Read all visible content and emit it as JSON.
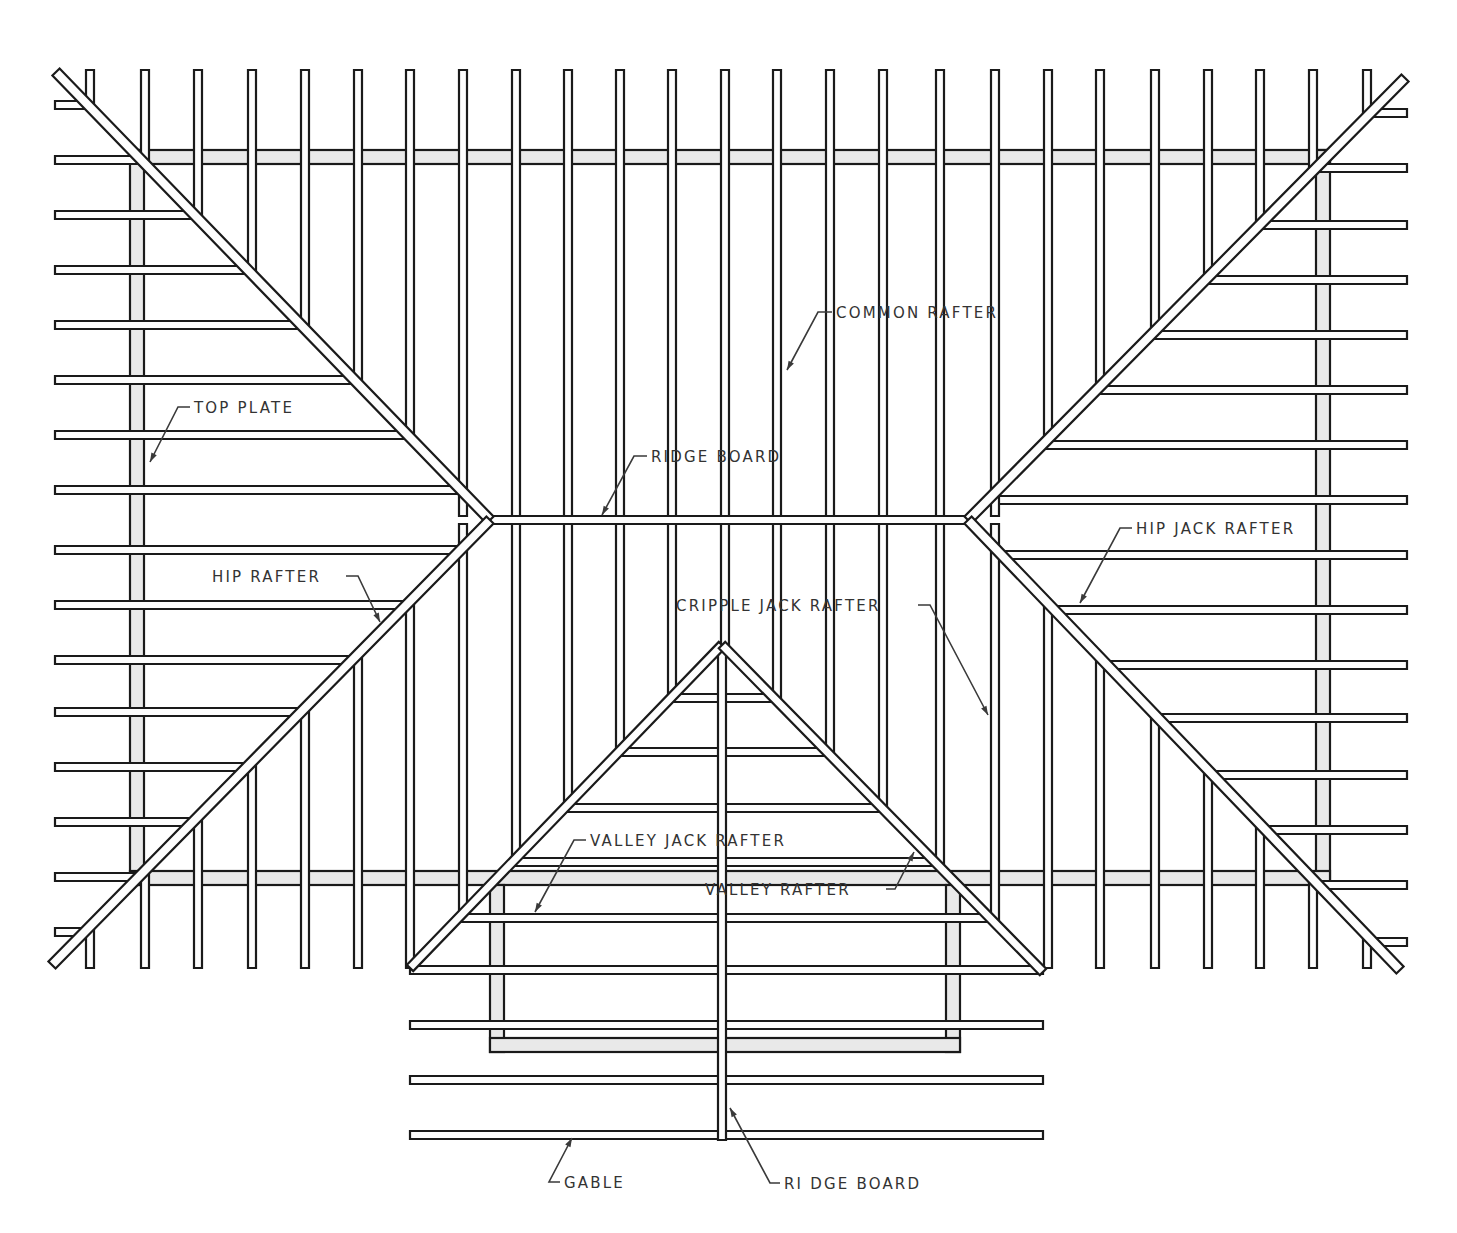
{
  "figure": {
    "colors": {
      "line": "#1a1a1a",
      "member_fill": "#fdfdfd",
      "plate_fill": "#e9e9e9",
      "label": "#333333"
    }
  },
  "labels": [
    {
      "id": "common-rafter",
      "text": "COMMON RAFTER",
      "x": 836,
      "y": 318,
      "leader": [
        [
          832,
          312
        ],
        [
          818,
          312
        ],
        [
          787,
          370
        ]
      ]
    },
    {
      "id": "top-plate",
      "text": "TOP PLATE",
      "x": 194,
      "y": 413,
      "leader": [
        [
          190,
          407
        ],
        [
          178,
          407
        ],
        [
          150,
          462
        ]
      ]
    },
    {
      "id": "ridge-board-main",
      "text": "RIDGE BOARD",
      "x": 651,
      "y": 462,
      "leader": [
        [
          647,
          456
        ],
        [
          634,
          456
        ],
        [
          602,
          515
        ]
      ]
    },
    {
      "id": "hip-rafter",
      "text": "HIP RAFTER",
      "x": 212,
      "y": 582,
      "leader": [
        [
          346,
          576
        ],
        [
          358,
          576
        ],
        [
          380,
          622
        ]
      ]
    },
    {
      "id": "hip-jack-rafter",
      "text": "HIP JACK RAFTER",
      "x": 1136,
      "y": 534,
      "leader": [
        [
          1132,
          528
        ],
        [
          1120,
          528
        ],
        [
          1080,
          603
        ]
      ]
    },
    {
      "id": "cripple-jack-rafter",
      "text": "CRIPPLE JACK RAFTER",
      "x": 676,
      "y": 611,
      "leader": [
        [
          918,
          605
        ],
        [
          930,
          605
        ],
        [
          988,
          715
        ]
      ]
    },
    {
      "id": "valley-jack-rafter",
      "text": "VALLEY JACK RAFTER",
      "x": 590,
      "y": 846,
      "leader": [
        [
          586,
          840
        ],
        [
          574,
          840
        ],
        [
          535,
          912
        ]
      ]
    },
    {
      "id": "valley-rafter",
      "text": "VALLEY RAFTER",
      "x": 705,
      "y": 895,
      "leader": [
        [
          886,
          889
        ],
        [
          895,
          889
        ],
        [
          914,
          852
        ]
      ]
    },
    {
      "id": "gable",
      "text": "GABLE",
      "x": 564,
      "y": 1188,
      "leader": [
        [
          560,
          1182
        ],
        [
          549,
          1182
        ],
        [
          572,
          1138
        ]
      ]
    },
    {
      "id": "ridge-board-gable",
      "text": "RI DGE BOARD",
      "x": 784,
      "y": 1189,
      "leader": [
        [
          780,
          1183
        ],
        [
          770,
          1183
        ],
        [
          730,
          1108
        ]
      ]
    }
  ],
  "geometry": {
    "top_plate": {
      "x1": 130,
      "y1": 150,
      "x2": 1330,
      "y2": 885,
      "thickness": 14
    },
    "valley_plate": {
      "x1": 490,
      "y1": 885,
      "x2": 960,
      "y2": 1052,
      "thickness": 14
    },
    "ridge_board": {
      "x1": 490,
      "y1": 520,
      "x2": 968,
      "y2": 520
    },
    "gable_ridge": {
      "x1": 722,
      "y1": 645,
      "x2": 722,
      "y2": 1140
    },
    "hips": [
      {
        "x1": 56,
        "y1": 72,
        "x2": 490,
        "y2": 520
      },
      {
        "x1": 490,
        "y1": 520,
        "x2": 52,
        "y2": 965
      },
      {
        "x1": 1405,
        "y1": 78,
        "x2": 968,
        "y2": 520
      },
      {
        "x1": 968,
        "y1": 520,
        "x2": 1400,
        "y2": 970
      }
    ],
    "valleys": [
      {
        "x1": 722,
        "y1": 645,
        "x2": 410,
        "y2": 968
      },
      {
        "x1": 722,
        "y1": 645,
        "x2": 1043,
        "y2": 972
      }
    ],
    "common_rafters_upper": [
      410,
      463,
      516,
      568,
      620,
      672,
      725,
      777,
      830,
      883,
      940,
      995,
      1048
    ],
    "left_jacks_h_y": [
      105,
      160,
      215,
      270,
      325,
      380,
      435,
      490,
      550,
      605,
      660,
      712,
      767,
      822,
      877,
      932
    ],
    "left_jacks_v_x": [
      90,
      145,
      198,
      252,
      305,
      358
    ],
    "right_jacks_h_y": [
      113,
      168,
      225,
      280,
      335,
      390,
      445,
      500,
      555,
      610,
      665,
      718,
      775,
      830,
      885,
      942
    ],
    "right_jacks_v_x": [
      1100,
      1155,
      1208,
      1260,
      1313,
      1367
    ],
    "valley_jacks_y": [
      698,
      752,
      808,
      862,
      918,
      970
    ],
    "gable_rafters_y": [
      1025,
      1080,
      1135
    ],
    "gable_span": {
      "x1": 410,
      "x2": 1043
    },
    "left_edge_x": 55,
    "right_edge_x": 1407,
    "top_y": 70,
    "bottom_y": 968,
    "member_w": 8
  }
}
